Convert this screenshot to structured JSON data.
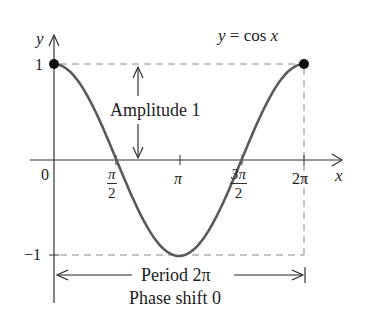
{
  "chart_data": {
    "type": "line",
    "title": "y = cos x",
    "function": "cos",
    "xlabel": "x",
    "ylabel": "y",
    "xlim": [
      0,
      6.2832
    ],
    "ylim": [
      -1,
      1
    ],
    "x_ticks": [
      {
        "value": 0,
        "label": "0"
      },
      {
        "value": 1.5708,
        "label": "π/2",
        "num": "π",
        "den": "2"
      },
      {
        "value": 3.1416,
        "label": "π"
      },
      {
        "value": 4.7124,
        "label": "3π/2",
        "num": "3π",
        "den": "2"
      },
      {
        "value": 6.2832,
        "label": "2π"
      }
    ],
    "y_ticks": [
      {
        "value": 1,
        "label": "1"
      },
      {
        "value": -1,
        "label": "−1"
      }
    ],
    "series": [
      {
        "name": "y = cos x",
        "color": "#555555",
        "x": [
          0,
          0.7854,
          1.5708,
          2.3562,
          3.1416,
          3.927,
          4.7124,
          5.4978,
          6.2832
        ],
        "y": [
          1,
          0.7071,
          0,
          -0.7071,
          -1,
          -0.7071,
          0,
          0.7071,
          1
        ]
      }
    ],
    "points": [
      {
        "x": 0,
        "y": 1
      },
      {
        "x": 6.2832,
        "y": 1
      }
    ],
    "annotations": {
      "amplitude": "Amplitude 1",
      "period": "Period 2π",
      "phase_shift": "Phase shift 0"
    },
    "grid": false,
    "dashed_guides": true
  },
  "labels": {
    "title_y": "y",
    "title_eq": " = cos ",
    "title_x": "x",
    "y_axis": "y",
    "x_axis": "x",
    "origin": "0",
    "y_one": "1",
    "y_neg_one": "−1",
    "pi": "π",
    "two_pi": "2π",
    "half_pi_num": "π",
    "half_pi_den": "2",
    "three_half_pi_num": "3π",
    "three_half_pi_den": "2",
    "amplitude": "Amplitude 1",
    "period": "Period 2π",
    "phase_shift": "Phase shift 0"
  }
}
